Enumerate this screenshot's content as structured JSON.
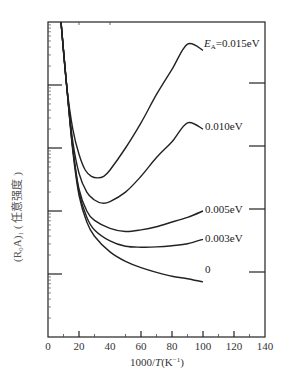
{
  "chart_data": {
    "type": "line",
    "title": "",
    "xlabel": "1000/T(K⁻¹)",
    "ylabel": "(R₀A)₁ (任意强度)",
    "xlim": [
      0,
      140
    ],
    "ylim": [
      0,
      100
    ],
    "y_units": "arbitrary",
    "x_ticks": [
      0,
      20,
      40,
      60,
      80,
      100,
      120,
      140
    ],
    "x_tick_labels": [
      "0",
      "20",
      "40",
      "60",
      "80",
      "100",
      "120",
      "140"
    ],
    "grid": false,
    "legend": "inline labels at curve ends",
    "series": [
      {
        "name": "EA=0.015eV",
        "label": "E_A=0.015eV",
        "x": [
          8.4,
          12,
          16,
          20,
          24,
          28,
          32,
          36,
          40,
          50,
          60,
          70,
          80,
          90,
          100
        ],
        "y": [
          100,
          80,
          66,
          58,
          53,
          51,
          50.5,
          51,
          53,
          60,
          68,
          77,
          85,
          93,
          91
        ]
      },
      {
        "name": "EA=0.010eV",
        "label": "0.010eV",
        "x": [
          8.4,
          12,
          16,
          20,
          25,
          30,
          35,
          40,
          50,
          60,
          70,
          80,
          90,
          100
        ],
        "y": [
          100,
          80,
          62,
          52,
          46,
          43.5,
          42.5,
          43,
          46,
          51,
          57,
          62,
          68,
          66
        ]
      },
      {
        "name": "EA=0.005eV",
        "label": "0.005eV",
        "x": [
          8.4,
          12,
          16,
          20,
          25,
          30,
          40,
          50,
          60,
          70,
          80,
          90,
          100
        ],
        "y": [
          100,
          80,
          60,
          47,
          40,
          37,
          34.5,
          33.5,
          34,
          35,
          36.5,
          38,
          40
        ]
      },
      {
        "name": "EA=0.003eV",
        "label": "0.003eV",
        "x": [
          8.4,
          12,
          16,
          20,
          25,
          30,
          40,
          50,
          60,
          70,
          80,
          90,
          100
        ],
        "y": [
          100,
          80,
          60,
          46,
          38,
          34,
          30.5,
          28.8,
          28.5,
          28.6,
          29,
          29.6,
          31
        ]
      },
      {
        "name": "EA=0",
        "label": "0",
        "x": [
          8.4,
          12,
          16,
          20,
          25,
          30,
          40,
          50,
          60,
          70,
          80,
          90,
          100
        ],
        "y": [
          100,
          80,
          59,
          45,
          36.5,
          32,
          27,
          24,
          22,
          20.5,
          19.3,
          18.5,
          17.5
        ]
      }
    ]
  },
  "labels": {
    "series_0": "E",
    "series_0_sub": "A",
    "series_0_rest": "=0.015eV",
    "series_1": "0.010eV",
    "series_2": "0.005eV",
    "series_3": "0.003eV",
    "series_4": "0",
    "xlabel_pre": "1000/",
    "xlabel_T": "T",
    "xlabel_post": "(K",
    "xlabel_sup": "−1",
    "xlabel_close": ")",
    "ylabel": "(R₀A)₁ ( 任意强度 )"
  }
}
